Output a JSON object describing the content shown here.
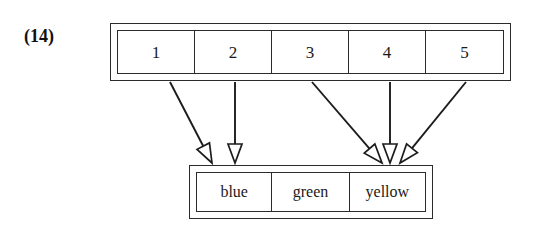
{
  "figure": {
    "label": "(14)",
    "caption": ""
  },
  "index_array": {
    "name": "index-array",
    "cells": [
      {
        "label": "1"
      },
      {
        "label": "2"
      },
      {
        "label": "3"
      },
      {
        "label": "4"
      },
      {
        "label": "5"
      }
    ]
  },
  "value_array": {
    "name": "value-array",
    "cells": [
      {
        "label": "blue"
      },
      {
        "label": "green"
      },
      {
        "label": "yellow"
      }
    ]
  },
  "mappings": [
    {
      "from": "1",
      "to": "blue",
      "from_x": 170,
      "from_y": 82,
      "to_x": 212,
      "to_y": 163
    },
    {
      "from": "2",
      "to": "blue",
      "from_x": 235,
      "from_y": 82,
      "to_x": 235,
      "to_y": 163
    },
    {
      "from": "3",
      "to": "yellow",
      "from_x": 312,
      "from_y": 82,
      "to_x": 382,
      "to_y": 163
    },
    {
      "from": "4",
      "to": "yellow",
      "from_x": 390,
      "from_y": 82,
      "to_x": 390,
      "to_y": 163
    },
    {
      "from": "5",
      "to": "yellow",
      "from_x": 466,
      "from_y": 82,
      "to_x": 400,
      "to_y": 163
    }
  ],
  "style": {
    "stroke_color": "#1c1c1c",
    "border_color": "#2b2b2b",
    "background_color": "#ffffff",
    "text_color": "#1a1a1a",
    "arrowhead": "hollow-triangle"
  }
}
